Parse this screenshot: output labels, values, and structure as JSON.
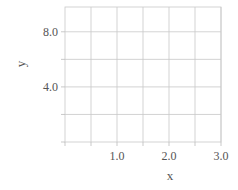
{
  "chart_data": {
    "type": "scatter",
    "title": "",
    "xlabel": "x",
    "ylabel": "y",
    "xlim": [
      0,
      3
    ],
    "ylim": [
      0,
      9.8
    ],
    "x_gridlines": [
      0.5,
      1.0,
      1.5,
      2.0,
      2.5,
      3.0
    ],
    "y_gridlines": [
      2,
      4,
      6,
      8
    ],
    "x_ticks": [
      {
        "value": 1.0,
        "label": "1.0"
      },
      {
        "value": 2.0,
        "label": "2.0"
      },
      {
        "value": 3.0,
        "label": "3.0"
      }
    ],
    "y_ticks": [
      {
        "value": 4.0,
        "label": "4.0"
      },
      {
        "value": 8.0,
        "label": "8.0"
      }
    ],
    "grid": true,
    "series": []
  }
}
